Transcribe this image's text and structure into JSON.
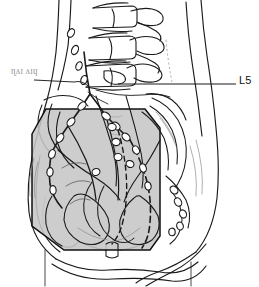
{
  "figure": {
    "kind": "medical-line-illustration",
    "width": 259,
    "height": 287,
    "background_color": "#ffffff",
    "line_color": "#1a1a1a",
    "field_fill_color": "#c6c6c6",
    "field_border_color": "#111111",
    "faint_line_color": "#8d8d8d"
  },
  "annotations": {
    "l5": {
      "label": "L5",
      "leader_line": true,
      "leader_from_x": 120,
      "leader_to_x": 236,
      "leader_y": 84
    },
    "left_margin_mark": {
      "label": "ɳʌɪ ʌɪɥ",
      "legible": false,
      "leader_line": true,
      "leader_from_x": 34,
      "leader_to_x": 76,
      "leader_y": 80
    }
  },
  "structures": {
    "body_outline": "abdominal and pelvic body contour, anterior-posterior view",
    "vertebrae": [
      "L3",
      "L4",
      "L5"
    ],
    "treatment_field": "octagonal shaded AP pelvic portal",
    "lymph_nodes": "para-aortic, common iliac, external iliac, internal iliac and inguinal node chains",
    "vessels": "aorta, common iliac and external iliac vessels",
    "bones": "lumbar spine, sacrum, iliac wings, acetabula, femoral heads, pubic symphysis"
  },
  "colors": {
    "field_gray": "#c6c6c6",
    "ink_black": "#1a1a1a",
    "label_gray": "#6d6d6d"
  }
}
